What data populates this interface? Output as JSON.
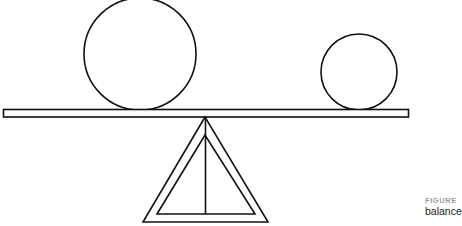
{
  "figure": {
    "label": "FIGURE",
    "caption": "balance",
    "colors": {
      "stroke": "#111111",
      "background": "#ffffff",
      "label": "#9a9a9a",
      "caption": "#222222"
    }
  },
  "diagram": {
    "plank": {
      "x": 3,
      "y": 109,
      "width": 405,
      "height": 8
    },
    "large_circle": {
      "cx": 140,
      "cy": 54,
      "r": 56
    },
    "small_circle": {
      "cx": 359,
      "cy": 72,
      "r": 38
    },
    "fulcrum": {
      "outer": [
        [
          205,
          117
        ],
        [
          143,
          222
        ],
        [
          268,
          222
        ]
      ],
      "inner": [
        [
          205,
          135
        ],
        [
          157,
          214
        ],
        [
          255,
          214
        ]
      ],
      "center_line": [
        [
          205,
          117
        ],
        [
          205,
          214
        ]
      ]
    }
  }
}
